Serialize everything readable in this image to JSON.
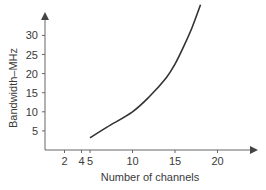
{
  "chart_data": {
    "type": "line",
    "title": "",
    "xlabel": "Number of channels",
    "ylabel": "Bandwidth–MHz",
    "x_ticks": [
      2,
      4,
      5,
      10,
      15,
      20
    ],
    "y_ticks": [
      5,
      10,
      15,
      20,
      25,
      30
    ],
    "xlim": [
      0,
      24
    ],
    "ylim": [
      0,
      38
    ],
    "grid": false,
    "legend": null,
    "series": [
      {
        "name": "Bandwidth",
        "x": [
          5,
          7,
          10,
          12,
          14,
          15,
          16,
          17,
          18
        ],
        "y": [
          3.2,
          6,
          10,
          14,
          19,
          22.5,
          27,
          32,
          38
        ]
      }
    ]
  },
  "colors": {
    "axis": "#555555",
    "line": "#333333",
    "text": "#3a3a3a"
  }
}
